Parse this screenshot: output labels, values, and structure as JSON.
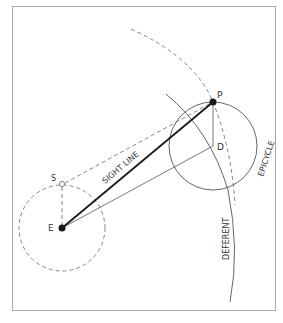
{
  "diagram": {
    "points": {
      "P": {
        "label": "P",
        "x": 213,
        "y": 102
      },
      "D": {
        "label": "D",
        "x": 213,
        "y": 146
      },
      "E": {
        "label": "E",
        "x": 62,
        "y": 228
      },
      "S": {
        "label": "S",
        "x": 62,
        "y": 184
      }
    },
    "labels": {
      "sight_line": "SIGHT LINE",
      "epicycle": "EPICYCLE",
      "deferent": "DEFERENT",
      "p": "P",
      "d": "D",
      "e": "E",
      "s": "S"
    },
    "colors": {
      "line": "#555555",
      "dark": "#1a1a1a",
      "frame": "#aaaaaa",
      "text": "#333333"
    }
  }
}
